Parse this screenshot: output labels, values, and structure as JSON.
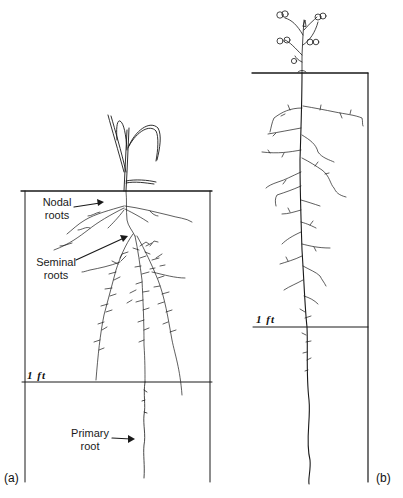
{
  "figure": {
    "panels": [
      {
        "id": "a",
        "tag": "(a)",
        "depth_marker": "1 ft",
        "plant": "grass seedling",
        "labels": {
          "nodal": [
            "Nodal",
            "roots"
          ],
          "seminal": [
            "Seminal",
            "roots"
          ],
          "primary": [
            "Primary",
            "root"
          ]
        }
      },
      {
        "id": "b",
        "tag": "(b)",
        "depth_marker": "1 ft",
        "plant": "taprooted flowering plant"
      }
    ],
    "colors": {
      "ink": "#1a1a1a",
      "background": "#ffffff"
    }
  }
}
